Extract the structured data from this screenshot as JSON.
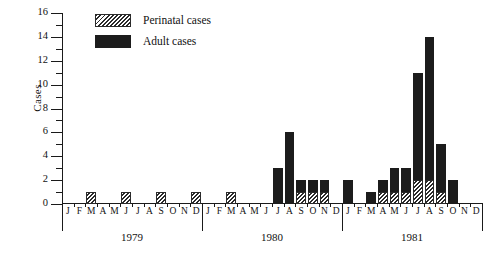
{
  "chart_data": {
    "type": "bar",
    "title": "",
    "xlabel": "",
    "ylabel": "Cases",
    "ylim": [
      0,
      16
    ],
    "ytick_step": 2,
    "yticks": [
      0,
      2,
      4,
      6,
      8,
      10,
      12,
      14,
      16
    ],
    "minor_yticks": [
      1,
      3,
      5,
      7,
      9,
      11,
      13,
      15
    ],
    "grid": false,
    "stacked": true,
    "legend_position": "top-left-inside",
    "month_initials": [
      "J",
      "F",
      "M",
      "A",
      "M",
      "J",
      "J",
      "A",
      "S",
      "O",
      "N",
      "D"
    ],
    "years": [
      "1979",
      "1980",
      "1981"
    ],
    "categories": [
      "J 1979",
      "F 1979",
      "M 1979",
      "A 1979",
      "M 1979",
      "J 1979",
      "J 1979",
      "A 1979",
      "S 1979",
      "O 1979",
      "N 1979",
      "D 1979",
      "J 1980",
      "F 1980",
      "M 1980",
      "A 1980",
      "M 1980",
      "J 1980",
      "J 1980",
      "A 1980",
      "S 1980",
      "O 1980",
      "N 1980",
      "D 1980",
      "J 1981",
      "F 1981",
      "M 1981",
      "A 1981",
      "M 1981",
      "J 1981",
      "J 1981",
      "A 1981",
      "S 1981",
      "O 1981",
      "N 1981",
      "D 1981"
    ],
    "series": [
      {
        "name": "Perinatal cases",
        "color": "#ffffff",
        "pattern": "diagonal-hatch",
        "values": [
          0,
          0,
          1,
          0,
          0,
          1,
          0,
          0,
          1,
          0,
          0,
          1,
          0,
          0,
          1,
          0,
          0,
          0,
          0,
          0,
          1,
          1,
          1,
          0,
          0,
          0,
          0,
          1,
          1,
          1,
          2,
          2,
          1,
          0,
          0,
          0
        ]
      },
      {
        "name": "Adult cases",
        "color": "#1c1c1c",
        "pattern": "solid",
        "values": [
          0,
          0,
          0,
          0,
          0,
          0,
          0,
          0,
          0,
          0,
          0,
          0,
          0,
          0,
          0,
          0,
          0,
          0,
          3,
          6,
          1,
          1,
          1,
          0,
          2,
          0,
          1,
          1,
          2,
          2,
          9,
          12,
          4,
          2,
          0,
          0
        ]
      }
    ],
    "totals": [
      0,
      0,
      1,
      0,
      0,
      1,
      0,
      0,
      1,
      0,
      0,
      1,
      0,
      0,
      1,
      0,
      0,
      0,
      3,
      6,
      2,
      2,
      2,
      0,
      2,
      0,
      1,
      2,
      3,
      3,
      11,
      14,
      5,
      2,
      0,
      0
    ]
  },
  "legend": {
    "items": [
      {
        "label": "Perinatal cases",
        "swatch": "hatch-swatch"
      },
      {
        "label": "Adult cases",
        "swatch": "solid-swatch"
      }
    ]
  },
  "axis": {
    "y_title": "Cases"
  }
}
